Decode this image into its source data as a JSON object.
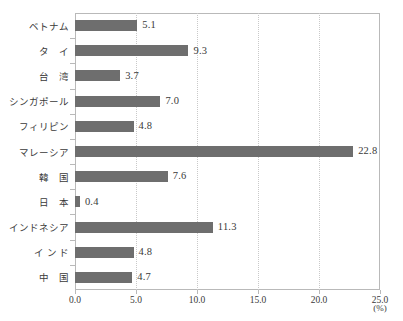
{
  "chart_data": {
    "type": "bar",
    "orientation": "horizontal",
    "title": "",
    "subtitle": "",
    "xlabel": "(%)",
    "ylabel": "",
    "categories": [
      "ベトナム",
      "タ　イ",
      "台　湾",
      "シンガポール",
      "フィリピン",
      "マレーシア",
      "韓　国",
      "日　本",
      "インドネシア",
      "イ ン ド",
      "中　国"
    ],
    "values": [
      5.1,
      9.3,
      3.7,
      7.0,
      4.8,
      22.8,
      7.6,
      0.4,
      11.3,
      4.8,
      4.7
    ],
    "value_labels": [
      "5.1",
      "9.3",
      "3.7",
      "7.0",
      "4.8",
      "22.8",
      "7.6",
      "0.4",
      "11.3",
      "4.8",
      "4.7"
    ],
    "xlim": [
      0.0,
      25.0
    ],
    "xticks": [
      0.0,
      5.0,
      10.0,
      15.0,
      20.0,
      25.0
    ],
    "xtick_labels": [
      "0.0",
      "5.0",
      "10.0",
      "15.0",
      "20.0",
      "25.0"
    ],
    "grid": true,
    "grid_axis": "x",
    "grid_style": "dotted",
    "legend": null,
    "bar_color": "#6e6e6e",
    "axis_color": "#b9b9b9",
    "grid_color": "#c9c9c9",
    "background_color": "#ffffff",
    "text_color": "#3a3a3a"
  }
}
